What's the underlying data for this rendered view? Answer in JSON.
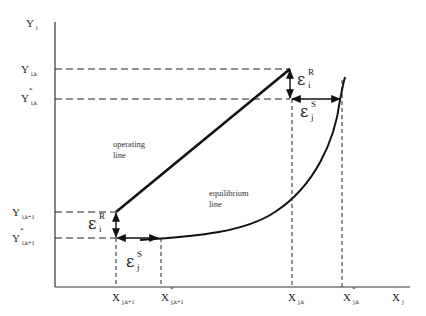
{
  "axes": {
    "y_label": {
      "main": "Y",
      "sub": "i"
    },
    "x_label": {
      "main": "X",
      "sub": "j"
    }
  },
  "y_ticks": [
    {
      "id": "y_ik",
      "main": "Y",
      "sub": "i,k",
      "star": ""
    },
    {
      "id": "y_ik_star",
      "main": "Y",
      "sub": "i,k",
      "star": "*"
    },
    {
      "id": "y_ik1",
      "main": "Y",
      "sub": "i,k+1",
      "star": ""
    },
    {
      "id": "y_ik1_star",
      "main": "Y",
      "sub": "i,k+1",
      "star": "*"
    }
  ],
  "x_ticks": [
    {
      "id": "x_jk1",
      "main": "X",
      "sub": "j,k+1",
      "star": ""
    },
    {
      "id": "x_jk1_star",
      "main": "X",
      "sub": "j,k+1",
      "star": "*"
    },
    {
      "id": "x_jk",
      "main": "X",
      "sub": "j,k",
      "star": ""
    },
    {
      "id": "x_jk_star",
      "main": "X",
      "sub": "j,k",
      "star": "*"
    }
  ],
  "annotations": {
    "eps_R_top": {
      "symbol": "ε",
      "sup": "R",
      "sub": "i"
    },
    "eps_S_top": {
      "symbol": "ε",
      "sup": "S",
      "sub": "j"
    },
    "eps_R_bottom": {
      "symbol": "ε",
      "sup": "R",
      "sub": "i"
    },
    "eps_S_bottom": {
      "symbol": "ε",
      "sup": "S",
      "sub": "j"
    }
  },
  "curves": {
    "operating_line": {
      "label_line1": "operating",
      "label_line2": "line"
    },
    "equilibrium_line": {
      "label_line1": "equilibrium",
      "label_line2": "line"
    }
  },
  "colors": {
    "ink": "#111111",
    "background": "#ffffff"
  }
}
